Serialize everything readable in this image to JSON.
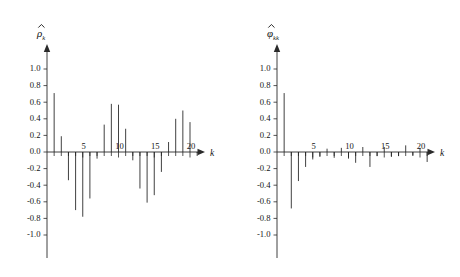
{
  "figure": {
    "panels": [
      "acf",
      "pacf"
    ]
  },
  "chart_data": [
    {
      "type": "bar",
      "id": "acf",
      "title": "",
      "xlabel": "k",
      "ylabel": "ρ̂_k",
      "ylabel_symbol": "ρ",
      "ylabel_subscript": "k",
      "ylim": [
        -1.0,
        1.0
      ],
      "xlim": [
        0,
        22
      ],
      "grid": false,
      "legend": null,
      "ytick_labels": [
        "1.0",
        "0.8",
        "0.6",
        "0.4",
        "0.2",
        "0.0",
        "-0.2",
        "-0.4",
        "-0.6",
        "-0.8",
        "-1.0"
      ],
      "ytick_values": [
        1.0,
        0.8,
        0.6,
        0.4,
        0.2,
        0.0,
        -0.2,
        -0.4,
        -0.6,
        -0.8,
        -1.0
      ],
      "xtick_labels": [
        "5",
        "10",
        "15",
        "20"
      ],
      "xtick_values": [
        5,
        10,
        15,
        20
      ],
      "x": [
        1,
        2,
        3,
        4,
        5,
        6,
        7,
        8,
        9,
        10,
        11,
        12,
        13,
        14,
        15,
        16,
        17,
        18,
        19,
        20,
        21
      ],
      "values": [
        0.71,
        0.19,
        -0.34,
        -0.7,
        -0.78,
        -0.56,
        -0.08,
        0.33,
        0.58,
        0.57,
        0.28,
        -0.1,
        -0.44,
        -0.61,
        -0.52,
        -0.24,
        0.12,
        0.4,
        0.5,
        0.36,
        -0.01
      ]
    },
    {
      "type": "bar",
      "id": "pacf",
      "title": "",
      "xlabel": "k",
      "ylabel": "φ̂_kk",
      "ylabel_symbol": "φ",
      "ylabel_subscript": "kk",
      "ylim": [
        -1.0,
        1.0
      ],
      "xlim": [
        0,
        22
      ],
      "grid": false,
      "legend": null,
      "ytick_labels": [
        "1.0",
        "0.8",
        "0.6",
        "0.4",
        "0.2",
        "0.0",
        "-0.2",
        "-0.4",
        "-0.6",
        "-0.8",
        "-1.0"
      ],
      "ytick_values": [
        1.0,
        0.8,
        0.6,
        0.4,
        0.2,
        0.0,
        -0.2,
        -0.4,
        -0.6,
        -0.8,
        -1.0
      ],
      "xtick_labels": [
        "5",
        "10",
        "15",
        "20"
      ],
      "xtick_values": [
        5,
        10,
        15,
        20
      ],
      "x": [
        1,
        2,
        3,
        4,
        5,
        6,
        7,
        8,
        9,
        10,
        11,
        12,
        13,
        14,
        15,
        16,
        17,
        18,
        19,
        20,
        21
      ],
      "values": [
        0.71,
        -0.68,
        -0.35,
        -0.18,
        -0.09,
        -0.06,
        0.04,
        -0.07,
        0.05,
        -0.08,
        -0.13,
        0.06,
        -0.18,
        -0.05,
        0.06,
        -0.06,
        -0.05,
        0.08,
        -0.04,
        0.05,
        -0.12
      ]
    }
  ]
}
